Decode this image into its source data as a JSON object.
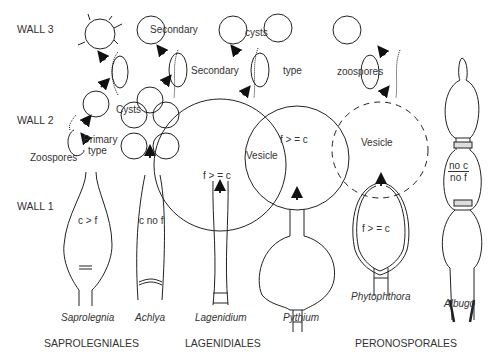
{
  "walls": {
    "wall3": "WALL 3",
    "wall2": "WALL 2",
    "wall1": "WALL 1"
  },
  "saprolegnia": {
    "zoospores": "Zoospores",
    "primary": "Primary",
    "type": "type",
    "cysts": "Cysts",
    "secondary_1": "Secondary",
    "secondary_2": "Secondary",
    "cysts_2": "cysts",
    "type_2": "type",
    "zoospores_2": "zoospores",
    "ratio": "c > f",
    "name": "Saprolegnia"
  },
  "achlya": {
    "ratio": "c no f",
    "name": "Achlya"
  },
  "lagenidium": {
    "ratio": "f > = c",
    "name": "Lagenidium"
  },
  "pythium": {
    "vesicle": "Vesicle",
    "ratio": "f > = c",
    "name": "Pythium"
  },
  "phytophthora": {
    "vesicle": "Vesicle",
    "ratio": "f > = c",
    "name": "Phytophthora"
  },
  "albugo": {
    "ratio_top": "no c",
    "ratio_bottom": "no f",
    "name": "Albugo"
  },
  "orders": {
    "saprolegniales": "SAPROLEGNIALES",
    "lagenidiales": "LAGENIDIALES",
    "peronosporales": "PERONOSPORALES"
  }
}
